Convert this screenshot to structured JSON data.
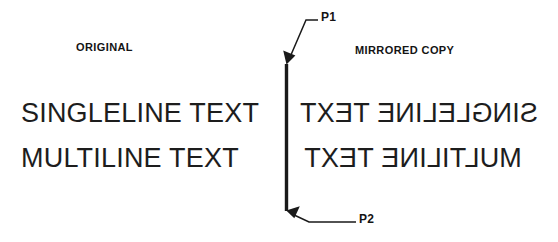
{
  "diagram": {
    "title_left": "ORIGINAL",
    "title_right": "MIRRORED COPY",
    "stroke_color": "#1a1a1a",
    "background_color": "#ffffff",
    "original_lines": [
      "SINGLELINE TEXT",
      "MULTILINE TEXT"
    ],
    "mirrored_lines": [
      "SINGLELINE TEXT",
      "MULTILINE TEXT"
    ],
    "mirror_axis": {
      "point_top_label": "P1",
      "point_bottom_label": "P2",
      "axis_x": 286,
      "axis_y_top": 64,
      "axis_y_bottom": 211
    }
  }
}
